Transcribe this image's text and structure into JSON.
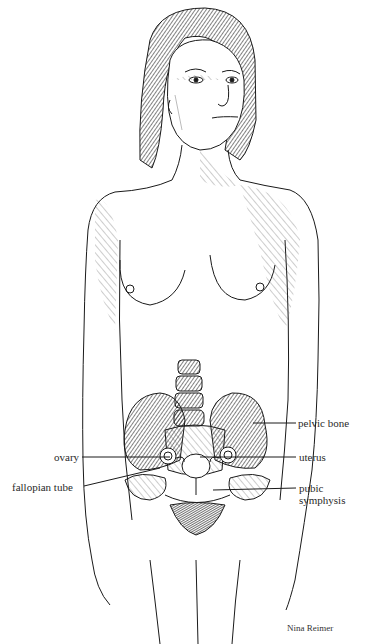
{
  "figure": {
    "labels": {
      "ovary": "ovary",
      "fallopian_tube": "fallopian tube",
      "pelvic_bone": "pelvic bone",
      "uterus": "uterus",
      "pubic_symphysis_line1": "pubic",
      "pubic_symphysis_line2": "symphysis"
    },
    "credit": "Nina Reimer"
  },
  "colors": {
    "ink": "#1a1a1a",
    "background": "#ffffff"
  }
}
